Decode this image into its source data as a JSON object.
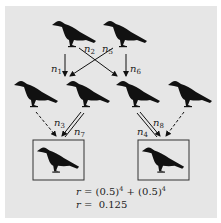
{
  "diagram": {
    "type": "pedigree-relatedness",
    "background_color": "#e6e6e6",
    "generations": [
      {
        "level": "grandparents",
        "count": 2
      },
      {
        "level": "parents",
        "count": 4
      },
      {
        "level": "offspring",
        "count": 2,
        "boxed": true
      }
    ],
    "edge_labels": [
      {
        "id": "n1",
        "base": "n",
        "sub": "1"
      },
      {
        "id": "n2",
        "base": "n",
        "sub": "2"
      },
      {
        "id": "n5",
        "base": "n",
        "sub": "5"
      },
      {
        "id": "n6",
        "base": "n",
        "sub": "6"
      },
      {
        "id": "n3",
        "base": "n",
        "sub": "3"
      },
      {
        "id": "n7",
        "base": "n",
        "sub": "7"
      },
      {
        "id": "n4",
        "base": "n",
        "sub": "4"
      },
      {
        "id": "n8",
        "base": "n",
        "sub": "8"
      }
    ],
    "formula": {
      "line1": {
        "var": "r",
        "eq": " = (0.5)",
        "exp1": "4",
        "mid": " + (0.5)",
        "exp2": "4"
      },
      "line2": {
        "var": "r",
        "eq": " =  0.125"
      }
    }
  }
}
